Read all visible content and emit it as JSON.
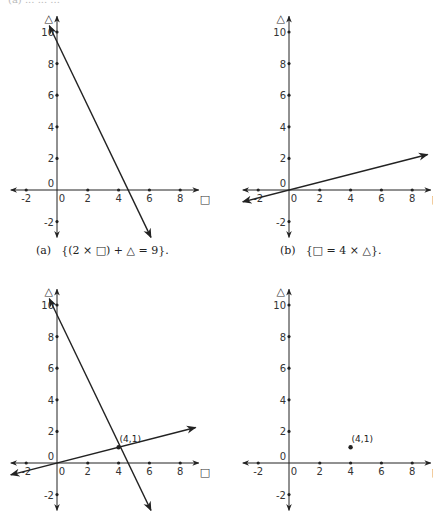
{
  "top_fragment": "(a) ...  ...  ...",
  "chart_data": [
    {
      "id": "a",
      "type": "line",
      "caption_tag": "(a)",
      "caption": "{(2 × □) + △ = 9}.",
      "xlabel": "□",
      "ylabel": "△",
      "xlim": [
        -3,
        9.2
      ],
      "ylim": [
        -3,
        11
      ],
      "x_ticks": [
        -2,
        0,
        2,
        4,
        6,
        8
      ],
      "x_tick_labels": [
        "-2",
        "0",
        "2",
        "4",
        "6",
        "8"
      ],
      "y_ticks": [
        -2,
        0,
        2,
        4,
        6,
        8,
        10
      ],
      "y_tick_labels": [
        "-2",
        "0",
        "2",
        "4",
        "6",
        "8",
        "10"
      ],
      "grid": false,
      "lines": [
        {
          "name": "2x + y = 9",
          "x": [
            -0.5,
            6.1
          ],
          "y": [
            10.4,
            -3.0
          ],
          "arrows": "both"
        }
      ],
      "points": []
    },
    {
      "id": "b",
      "type": "line",
      "caption_tag": "(b)",
      "caption": "{□ = 4 × △}.",
      "xlabel": "□",
      "ylabel": "△",
      "xlim": [
        -3,
        9.2
      ],
      "ylim": [
        -3,
        11
      ],
      "x_ticks": [
        -2,
        0,
        2,
        4,
        6,
        8
      ],
      "x_tick_labels": [
        "-2",
        "0",
        "2",
        "4",
        "6",
        "8"
      ],
      "y_ticks": [
        -2,
        0,
        2,
        4,
        6,
        8,
        10
      ],
      "y_tick_labels": [
        "-2",
        "0",
        "2",
        "4",
        "6",
        "8",
        "10"
      ],
      "grid": false,
      "lines": [
        {
          "name": "x = 4y",
          "x": [
            -3.0,
            9.0
          ],
          "y": [
            -0.75,
            2.25
          ],
          "arrows": "both"
        }
      ],
      "points": []
    },
    {
      "id": "c",
      "type": "line",
      "caption_tag": "",
      "caption": "",
      "xlabel": "□",
      "ylabel": "△",
      "xlim": [
        -3,
        9.2
      ],
      "ylim": [
        -3,
        11
      ],
      "x_ticks": [
        -2,
        0,
        2,
        4,
        6,
        8
      ],
      "x_tick_labels": [
        "-2",
        "0",
        "2",
        "4",
        "6",
        "8"
      ],
      "y_ticks": [
        -2,
        0,
        2,
        4,
        6,
        8,
        10
      ],
      "y_tick_labels": [
        "-2",
        "0",
        "2",
        "4",
        "6",
        "8",
        "10"
      ],
      "grid": false,
      "lines": [
        {
          "name": "2x + y = 9",
          "x": [
            -0.5,
            6.1
          ],
          "y": [
            10.4,
            -3.0
          ],
          "arrows": "both"
        },
        {
          "name": "x = 4y",
          "x": [
            -3.0,
            9.0
          ],
          "y": [
            -0.75,
            2.25
          ],
          "arrows": "both"
        }
      ],
      "points": [
        {
          "x": 4,
          "y": 1,
          "label": "(4,1)"
        }
      ]
    },
    {
      "id": "d",
      "type": "scatter",
      "caption_tag": "",
      "caption": "",
      "xlabel": "□",
      "ylabel": "△",
      "xlim": [
        -3,
        9.2
      ],
      "ylim": [
        -3,
        11
      ],
      "x_ticks": [
        -2,
        0,
        2,
        4,
        6,
        8
      ],
      "x_tick_labels": [
        "-2",
        "0",
        "2",
        "4",
        "6",
        "8"
      ],
      "y_ticks": [
        -2,
        0,
        2,
        4,
        6,
        8,
        10
      ],
      "y_tick_labels": [
        "-2",
        "0",
        "2",
        "4",
        "6",
        "8",
        "10"
      ],
      "grid": false,
      "lines": [],
      "points": [
        {
          "x": 4,
          "y": 1,
          "label": "(4,1)"
        }
      ]
    }
  ],
  "layout": {
    "panels": [
      {
        "id": "a",
        "origin": [
          57,
          190
        ],
        "caption_pos": [
          36,
          244
        ]
      },
      {
        "id": "b",
        "origin": [
          289,
          190
        ],
        "caption_pos": [
          280,
          244
        ]
      },
      {
        "id": "c",
        "origin": [
          57,
          463
        ],
        "caption_pos": null
      },
      {
        "id": "d",
        "origin": [
          289,
          463
        ],
        "caption_pos": null
      }
    ],
    "unit_x": 15.4,
    "unit_y": 15.8
  },
  "colors": {
    "ink": "#222222",
    "background": "#ffffff"
  }
}
